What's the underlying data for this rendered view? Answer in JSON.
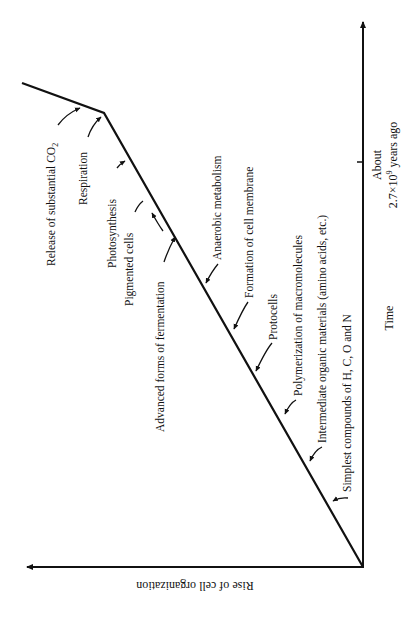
{
  "diagram": {
    "orientation": "rotated 90 degrees counter-clockwise",
    "colors": {
      "ink": "#111111",
      "background": "#ffffff"
    },
    "axes": {
      "time_axis_label": "Time",
      "organization_axis_label": "Rise of cell organization",
      "time_marker_line1": "About",
      "time_marker_line2": "2.7×10",
      "time_marker_exp": "9",
      "time_marker_suffix": " years ago"
    },
    "stages": [
      {
        "label": "Simplest compounds of H, C, O and N"
      },
      {
        "label": "Intermediate organic materials (amino acids, etc.)"
      },
      {
        "label": "Polymerization of macromolecules"
      },
      {
        "label": "Protocells"
      },
      {
        "label": "Formation of cell membrane"
      },
      {
        "label": "Anaerobic metabolism"
      },
      {
        "label": "Advanced forms of fermentation"
      },
      {
        "label": "Pigmented cells"
      },
      {
        "label": "Photosynthesis"
      },
      {
        "label": "Respiration"
      },
      {
        "label": "Release of substantial CO",
        "subscript": "2"
      }
    ]
  }
}
